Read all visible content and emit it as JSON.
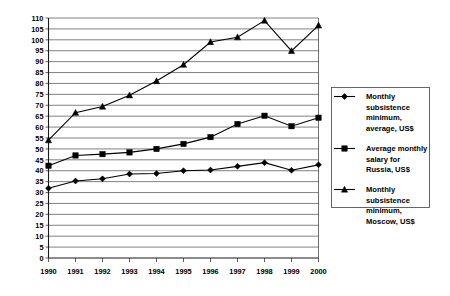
{
  "chart_data": {
    "type": "line",
    "title": "",
    "subtitle": "",
    "xlabel": "",
    "ylabel": "",
    "x": [
      1990,
      1991,
      1992,
      1993,
      1994,
      1995,
      1996,
      1997,
      1998,
      1999,
      2000
    ],
    "categories": [
      "1990",
      "1991",
      "1992",
      "1993",
      "1994",
      "1995",
      "1996",
      "1997",
      "1998",
      "1999",
      "2000"
    ],
    "xlim": [
      1990,
      2000
    ],
    "ylim": [
      0,
      110
    ],
    "ytick_step": 5,
    "yticks": [
      0,
      5,
      10,
      15,
      20,
      25,
      30,
      35,
      40,
      45,
      50,
      55,
      60,
      65,
      70,
      75,
      80,
      85,
      90,
      95,
      100,
      105,
      110
    ],
    "ytick_labels": [
      "0",
      "5",
      "10",
      "15",
      "20",
      "25",
      "30",
      "35",
      "40",
      "45",
      "50",
      "55",
      "60",
      "65",
      "70",
      "75",
      "80",
      "85",
      "90",
      "95",
      "100",
      "105",
      "110"
    ],
    "grid": true,
    "grid_axis": "y",
    "legend_position": "right",
    "series": [
      {
        "name": "Monthly subsistence minimum, average, US$",
        "marker": "diamond",
        "color": "#000000",
        "values": [
          32.0,
          35.3,
          36.3,
          38.5,
          38.7,
          40.0,
          40.3,
          42.0,
          43.7,
          40.2,
          42.7
        ]
      },
      {
        "name": "Average monthly salary for Russia, US$",
        "marker": "square",
        "color": "#000000",
        "values": [
          42.3,
          47.0,
          47.6,
          48.4,
          50.0,
          52.3,
          55.4,
          61.4,
          65.2,
          60.4,
          64.3
        ]
      },
      {
        "name": "Monthly subsistence minimum, Moscow, US$",
        "marker": "triangle",
        "color": "#000000",
        "values": [
          54.0,
          66.6,
          69.4,
          74.6,
          81.1,
          88.6,
          99.0,
          101.2,
          108.8,
          94.9,
          106.6
        ]
      }
    ]
  },
  "legend": {
    "entries": [
      {
        "marker": "diamond",
        "lines": [
          "Monthly",
          "subsistence",
          "minimum,",
          "average, US$"
        ]
      },
      {
        "marker": "square",
        "lines": [
          "Average monthly",
          "salary for",
          "Russia, US$"
        ]
      },
      {
        "marker": "triangle",
        "lines": [
          "Monthly",
          "subsistence",
          "minimum,",
          "Moscow, US$"
        ]
      }
    ]
  }
}
